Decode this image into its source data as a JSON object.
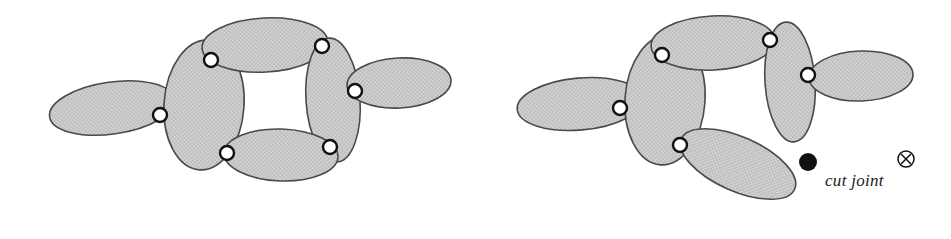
{
  "figure": {
    "background_color": "#ffffff",
    "link_fill_color": "#c9c9c9",
    "link_stroke_color": "#4a4a4a",
    "joint_fill_color": "#ffffff",
    "joint_stroke_color": "#111111",
    "cut_marker_color": "#111111"
  },
  "legend": {
    "cut_joint_label": "cut joint",
    "filled_dot_symbol": "filled-circle",
    "circled_x_symbol": "⊗"
  },
  "diagrams": [
    {
      "id": "closed-loop",
      "name": "closed-loop-mechanism",
      "caption": "",
      "links": [
        {
          "id": "L1",
          "name": "left-distal-link",
          "cx": 112,
          "cy": 108,
          "rx": 63,
          "ry": 26,
          "rot": -8
        },
        {
          "id": "L2",
          "name": "left-vertical-link",
          "cx": 204,
          "cy": 105,
          "rx": 40,
          "ry": 65,
          "rot": 4
        },
        {
          "id": "L3",
          "name": "top-link",
          "cx": 265,
          "cy": 45,
          "rx": 63,
          "ry": 27,
          "rot": -3
        },
        {
          "id": "L4",
          "name": "right-vertical-link",
          "cx": 333,
          "cy": 100,
          "rx": 27,
          "ry": 62,
          "rot": -4
        },
        {
          "id": "L5",
          "name": "bottom-link",
          "cx": 281,
          "cy": 155,
          "rx": 57,
          "ry": 26,
          "rot": 2
        },
        {
          "id": "L6",
          "name": "right-distal-link",
          "cx": 399,
          "cy": 83,
          "rx": 52,
          "ry": 25,
          "rot": -3
        }
      ],
      "joints": [
        {
          "id": "J1",
          "name": "joint-left",
          "cx": 160,
          "cy": 115,
          "r": 7
        },
        {
          "id": "J2",
          "name": "joint-top-left",
          "cx": 211,
          "cy": 60,
          "r": 7
        },
        {
          "id": "J3",
          "name": "joint-top-right",
          "cx": 322,
          "cy": 46,
          "r": 7
        },
        {
          "id": "J4",
          "name": "joint-bottom-left",
          "cx": 227,
          "cy": 153,
          "r": 7
        },
        {
          "id": "J5",
          "name": "joint-bottom-right",
          "cx": 330,
          "cy": 147,
          "r": 7
        },
        {
          "id": "J6",
          "name": "joint-right",
          "cx": 355,
          "cy": 91,
          "r": 7
        }
      ]
    },
    {
      "id": "cut-loop",
      "name": "cut-joint-mechanism",
      "caption": "",
      "links": [
        {
          "id": "R1",
          "name": "left-distal-link",
          "cx": 580,
          "cy": 104,
          "rx": 63,
          "ry": 26,
          "rot": -5
        },
        {
          "id": "R2",
          "name": "left-vertical-link",
          "cx": 665,
          "cy": 100,
          "rx": 40,
          "ry": 65,
          "rot": 4
        },
        {
          "id": "R3",
          "name": "top-link",
          "cx": 713,
          "cy": 43,
          "rx": 62,
          "ry": 27,
          "rot": -3
        },
        {
          "id": "R4",
          "name": "right-vertical-link",
          "cx": 790,
          "cy": 82,
          "rx": 25,
          "ry": 60,
          "rot": -4
        },
        {
          "id": "R5",
          "name": "bottom-swung-link",
          "cx": 738,
          "cy": 164,
          "rx": 62,
          "ry": 27,
          "rot": 24
        },
        {
          "id": "R6",
          "name": "right-distal-link",
          "cx": 861,
          "cy": 76,
          "rx": 52,
          "ry": 25,
          "rot": -2
        }
      ],
      "joints": [
        {
          "id": "K1",
          "name": "joint-left",
          "cx": 620,
          "cy": 108,
          "r": 7
        },
        {
          "id": "K2",
          "name": "joint-top-left",
          "cx": 662,
          "cy": 55,
          "r": 7
        },
        {
          "id": "K3",
          "name": "joint-top-right",
          "cx": 770,
          "cy": 40,
          "r": 7
        },
        {
          "id": "K4",
          "name": "joint-bottom-left",
          "cx": 680,
          "cy": 145,
          "r": 7
        },
        {
          "id": "K5",
          "name": "joint-right",
          "cx": 808,
          "cy": 75,
          "r": 7
        }
      ],
      "cut_marker": {
        "name": "cut-joint-dot",
        "cx": 808,
        "cy": 162,
        "r": 9
      }
    }
  ],
  "legend_layout": {
    "dot": {
      "cx": 808,
      "cy": 162,
      "r": 9
    },
    "label_x": 825,
    "label_y": 186,
    "circled_x": {
      "cx": 906,
      "cy": 159,
      "r": 8
    }
  }
}
